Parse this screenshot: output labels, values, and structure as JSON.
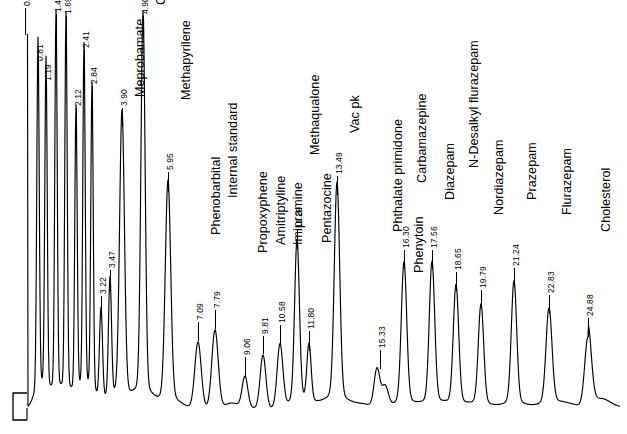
{
  "figure": {
    "kind": "gas-chromatogram",
    "background_color": "#ffffff",
    "trace_color": "#000000",
    "baseline_y_px": 408,
    "axis_marker": "L-shaped axis corner at lower left"
  },
  "chart_data": {
    "type": "line",
    "title": "",
    "subtitle": "",
    "xlabel": "",
    "ylabel": "",
    "xlim": [
      0,
      26
    ],
    "ylim": [
      0,
      1
    ],
    "grid": false,
    "legend": null,
    "axis_note": "Retention-time (min) labels printed vertically above each peak; compound names printed vertically where identified.",
    "peaks": [
      {
        "rt": "0.27",
        "name": "",
        "x": 25,
        "top": 36,
        "width": 5,
        "shape": "flat-top",
        "label_y": 6,
        "name_y": 0
      },
      {
        "rt": "0.81",
        "name": "",
        "x": 38,
        "top": 62,
        "width": 4,
        "shape": "spike",
        "label_y": 61
      },
      {
        "rt": "1.19",
        "name": "",
        "x": 46,
        "top": 82,
        "width": 4,
        "shape": "spike",
        "label_y": 81
      },
      {
        "rt": "1.42",
        "name": "",
        "x": 56,
        "top": 36,
        "width": 4,
        "shape": "spike",
        "label_y": 12
      },
      {
        "rt": "1.69",
        "name": "",
        "x": 66,
        "top": 38,
        "width": 4,
        "shape": "spike",
        "label_y": 14
      },
      {
        "rt": "2.12",
        "name": "",
        "x": 76,
        "top": 128,
        "width": 4,
        "shape": "spike",
        "label_y": 106
      },
      {
        "rt": "2.41",
        "name": "",
        "x": 84,
        "top": 70,
        "width": 4,
        "shape": "spike",
        "label_y": 48
      },
      {
        "rt": "2.84",
        "name": "",
        "x": 92,
        "top": 106,
        "width": 4,
        "shape": "spike",
        "label_y": 84
      },
      {
        "rt": "3.22",
        "name": "",
        "x": 101,
        "top": 318,
        "width": 5,
        "shape": "spike",
        "label_y": 294
      },
      {
        "rt": "3.47",
        "name": "",
        "x": 110,
        "top": 292,
        "width": 5,
        "shape": "spike",
        "label_y": 268
      },
      {
        "rt": "3.90",
        "name": "Meprobamate",
        "x": 122,
        "top": 128,
        "width": 8,
        "shape": "spike",
        "label_y": 106,
        "name_y": 97
      },
      {
        "rt": "4.90",
        "name": "Caffeine",
        "x": 143,
        "top": 36,
        "width": 7,
        "shape": "spike",
        "label_y": 14,
        "name_y": 5
      },
      {
        "rt": "5.95",
        "name": "Methapyrilene",
        "x": 168,
        "top": 193,
        "width": 9,
        "shape": "spike",
        "label_y": 170,
        "name_y": 100
      },
      {
        "rt": "7.09",
        "name": "Phenobarbital",
        "x": 198,
        "top": 342,
        "width": 9,
        "shape": "gauss",
        "label_y": 320,
        "name_y": 235
      },
      {
        "rt": "7.79",
        "name": "Internal standard",
        "x": 215,
        "top": 330,
        "width": 9,
        "shape": "gauss",
        "label_y": 308,
        "name_y": 198
      },
      {
        "rt": "9.06",
        "name": "Propoxyphene",
        "x": 245,
        "top": 377,
        "width": 8,
        "shape": "gauss",
        "label_y": 355,
        "name_y": 253
      },
      {
        "rt": "9.81",
        "name": "Amitriptyline",
        "x": 263,
        "top": 355,
        "width": 8,
        "shape": "gauss",
        "label_y": 334,
        "name_y": 245
      },
      {
        "rt": "10.58",
        "name": "Imipramine",
        "x": 280,
        "top": 345,
        "width": 8,
        "shape": "gauss",
        "label_y": 323,
        "name_y": 245
      },
      {
        "rt": "11.29",
        "name": "Methaqualone",
        "x": 297,
        "top": 250,
        "width": 8,
        "shape": "spike",
        "label_y": 228,
        "name_y": 155
      },
      {
        "rt": "11.80",
        "name": "Pentazocine",
        "x": 309,
        "top": 352,
        "width": 7,
        "shape": "spike",
        "label_y": 329,
        "name_y": 243
      },
      {
        "rt": "13.49",
        "name": "Vac pk",
        "x": 337,
        "top": 196,
        "width": 9,
        "shape": "spike",
        "label_y": 174,
        "name_y": 133
      },
      {
        "rt": "15.33",
        "name": "Phthalate primidone",
        "x": 380,
        "top": 370,
        "width": 9,
        "shape": "doublet",
        "label_y": 348,
        "name_y": 232
      },
      {
        "rt": "16.30",
        "name": "Carbamazepine",
        "x": 404,
        "top": 270,
        "width": 9,
        "shape": "spike",
        "label_y": 248,
        "name_y": 183
      },
      {
        "rt": "",
        "name": "Phenytoin",
        "x": 0,
        "top": 0,
        "width": 0,
        "shape": "name-only",
        "name_x": 412,
        "name_y": 273
      },
      {
        "rt": "17.56",
        "name": "Diazepam",
        "x": 432,
        "top": 270,
        "width": 9,
        "shape": "spike",
        "label_y": 248,
        "name_y": 200
      },
      {
        "rt": "18.65",
        "name": "N-Desalkyl flurazepam",
        "x": 456,
        "top": 292,
        "width": 9,
        "shape": "spike",
        "label_y": 270,
        "name_y": 168
      },
      {
        "rt": "19.79",
        "name": "Nordiazepam",
        "x": 481,
        "top": 310,
        "width": 9,
        "shape": "spike",
        "label_y": 288,
        "name_y": 215
      },
      {
        "rt": "21.24",
        "name": "Prazepam",
        "x": 514,
        "top": 288,
        "width": 9,
        "shape": "spike",
        "label_y": 266,
        "name_y": 200
      },
      {
        "rt": "22.83",
        "name": "Flurazepam",
        "x": 549,
        "top": 315,
        "width": 10,
        "shape": "spike",
        "label_y": 293,
        "name_y": 215
      },
      {
        "rt": "24.88",
        "name": "Cholesterol",
        "x": 588,
        "top": 338,
        "width": 11,
        "shape": "tailing",
        "label_y": 316,
        "name_y": 232
      }
    ]
  }
}
